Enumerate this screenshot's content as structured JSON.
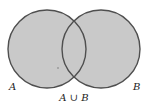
{
  "diagram": {
    "type": "venn",
    "shaded_region": "union",
    "colors": {
      "background": "#ffffff",
      "fill": "#c9c9c9",
      "outline": "#4f4f4f",
      "text": "#222222",
      "dot": "#7a7a7a"
    },
    "sets": [
      {
        "id": "A",
        "label": "A",
        "cx": 47,
        "cy": 49,
        "r": 39,
        "label_x": 9,
        "label_y": 90
      },
      {
        "id": "B",
        "label": "B",
        "cx": 101,
        "cy": 49,
        "r": 39,
        "label_x": 133,
        "label_y": 90
      }
    ],
    "caption": {
      "text": "A ∪ B",
      "x": 74,
      "y": 101
    },
    "dot": {
      "cx": 58,
      "cy": 68,
      "r": 0.8
    }
  }
}
